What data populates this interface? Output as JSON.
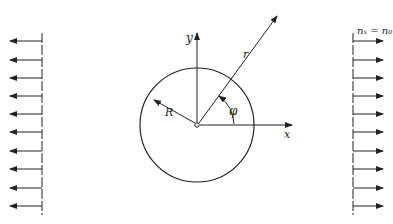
{
  "diagram": {
    "labels": {
      "y_axis": "y",
      "x_axis": "x",
      "radius": "R",
      "polar_radius": "r",
      "angle": "φ",
      "load": "nₓ = n₀"
    },
    "colors": {
      "stroke": "#222222",
      "background": "#ffffff"
    },
    "left_load": {
      "wall_x": 42,
      "arrow_tip_x": 10,
      "arrow_y": [
        41,
        60,
        78,
        96,
        114,
        132,
        151,
        169,
        188,
        206
      ]
    },
    "right_load": {
      "wall_x": 353,
      "arrow_tip_x": 383,
      "arrow_y": [
        41,
        60,
        78,
        96,
        114,
        132,
        151,
        169,
        188,
        206
      ]
    },
    "hole": {
      "cx": 197,
      "cy": 125,
      "r": 57
    }
  }
}
